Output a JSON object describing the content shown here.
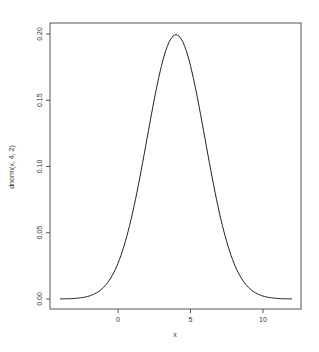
{
  "chart_data": {
    "type": "line",
    "title": "",
    "xlabel": "x",
    "ylabel": "dnorm(x, 4, 2)",
    "xlim": [
      -4,
      12
    ],
    "ylim": [
      0,
      0.2
    ],
    "x_ticks": [
      0,
      5,
      10
    ],
    "x_tick_labels": [
      "0",
      "5",
      "10"
    ],
    "y_ticks": [
      0.0,
      0.05,
      0.1,
      0.15,
      0.2
    ],
    "y_tick_labels": [
      "0.00",
      "0.05",
      "0.10",
      "0.15",
      "0.20"
    ],
    "grid": false,
    "legend": null,
    "series": [
      {
        "name": "dnorm(x, 4, 2)",
        "function": "normal density, mean 4, sd 2",
        "x": [
          -4,
          -3,
          -2,
          -1,
          0,
          1,
          2,
          3,
          4,
          5,
          6,
          7,
          8,
          9,
          10,
          11,
          12
        ],
        "values": [
          0.0001,
          0.0004,
          0.0022,
          0.0088,
          0.027,
          0.0648,
          0.121,
          0.176,
          0.1995,
          0.176,
          0.121,
          0.0648,
          0.027,
          0.0088,
          0.0022,
          0.0004,
          0.0001
        ]
      }
    ]
  },
  "colors": {
    "line": "#222222",
    "axis": "#555555",
    "background": "#ffffff"
  }
}
